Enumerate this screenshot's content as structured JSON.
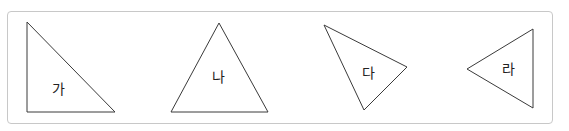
{
  "figure": {
    "frame": {
      "border_color": "#c8c8c8"
    },
    "triangles": [
      {
        "label": "가",
        "points": [
          [
            27,
            22
          ],
          [
            27,
            112
          ],
          [
            115,
            112
          ]
        ],
        "label_pos": [
          58,
          90
        ]
      },
      {
        "label": "나",
        "points": [
          [
            219,
            23
          ],
          [
            171,
            112
          ],
          [
            268,
            112
          ]
        ],
        "label_pos": [
          218,
          78
        ]
      },
      {
        "label": "다",
        "points": [
          [
            324,
            25
          ],
          [
            407,
            67
          ],
          [
            364,
            110
          ]
        ],
        "label_pos": [
          368,
          74
        ]
      },
      {
        "label": "라",
        "points": [
          [
            533,
            29
          ],
          [
            467,
            69
          ],
          [
            533,
            108
          ]
        ],
        "label_pos": [
          508,
          70
        ]
      }
    ],
    "stroke_color": "#3a3a3a"
  }
}
